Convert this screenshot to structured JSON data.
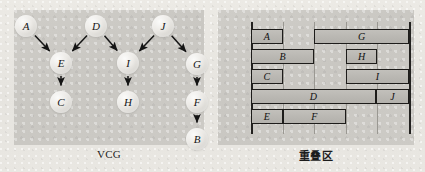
{
  "figure": {
    "background_color": "#e8e6e1",
    "panel_color": "#cbc9c4"
  },
  "left_panel": {
    "caption": "VCG",
    "type": "directed-graph",
    "nodes": [
      {
        "id": "A",
        "label": "A",
        "cx": 26,
        "cy": 26
      },
      {
        "id": "D",
        "label": "D",
        "cx": 96,
        "cy": 26
      },
      {
        "id": "J",
        "label": "J",
        "cx": 163,
        "cy": 26
      },
      {
        "id": "E",
        "label": "E",
        "cx": 61,
        "cy": 63
      },
      {
        "id": "I",
        "label": "I",
        "cx": 128,
        "cy": 63
      },
      {
        "id": "G",
        "label": "G",
        "cx": 197,
        "cy": 64
      },
      {
        "id": "C",
        "label": "C",
        "cx": 61,
        "cy": 102
      },
      {
        "id": "H",
        "label": "H",
        "cx": 128,
        "cy": 102
      },
      {
        "id": "F",
        "label": "F",
        "cx": 197,
        "cy": 102
      },
      {
        "id": "B",
        "label": "B",
        "cx": 197,
        "cy": 139
      }
    ],
    "edges": [
      {
        "from": "A",
        "to": "E"
      },
      {
        "from": "D",
        "to": "E"
      },
      {
        "from": "D",
        "to": "I"
      },
      {
        "from": "J",
        "to": "I"
      },
      {
        "from": "J",
        "to": "G"
      },
      {
        "from": "E",
        "to": "C"
      },
      {
        "from": "I",
        "to": "H"
      },
      {
        "from": "G",
        "to": "F"
      },
      {
        "from": "F",
        "to": "B"
      }
    ]
  },
  "right_panel": {
    "caption": "重叠区",
    "chart_data": {
      "type": "bar",
      "orientation": "horizontal",
      "title": "重叠区",
      "xlabel": "",
      "ylabel": "",
      "xlim": [
        0,
        6
      ],
      "grid": true,
      "gridlines_x": [
        0,
        1,
        2,
        3,
        4,
        5
      ],
      "axis_left_x": 0,
      "axis_right_x": 5,
      "rows": [
        {
          "row": 1,
          "bars": [
            {
              "label": "A",
              "start": 0,
              "end": 1
            },
            {
              "label": "G",
              "start": 2,
              "end": 5
            }
          ]
        },
        {
          "row": 2,
          "bars": [
            {
              "label": "B",
              "start": 0,
              "end": 2
            },
            {
              "label": "H",
              "start": 3,
              "end": 4
            }
          ]
        },
        {
          "row": 3,
          "bars": [
            {
              "label": "C",
              "start": 0,
              "end": 1
            },
            {
              "label": "I",
              "start": 3,
              "end": 5
            }
          ]
        },
        {
          "row": 4,
          "bars": [
            {
              "label": "D",
              "start": 0,
              "end": 3.95
            },
            {
              "label": "J",
              "start": 3.95,
              "end": 5
            }
          ]
        },
        {
          "row": 5,
          "bars": [
            {
              "label": "E",
              "start": 0,
              "end": 1
            },
            {
              "label": "F",
              "start": 1,
              "end": 3
            }
          ]
        }
      ]
    }
  }
}
